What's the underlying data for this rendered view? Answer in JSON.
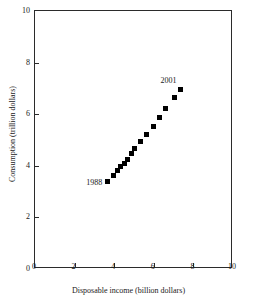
{
  "chart_data": {
    "type": "scatter",
    "title": "",
    "xlabel": "Disposable income (billion dollars)",
    "ylabel": "Consumption (trillion dollars)",
    "xlim": [
      0,
      10
    ],
    "ylim": [
      0,
      10
    ],
    "xticks": [
      0,
      2,
      4,
      6,
      8,
      10
    ],
    "yticks": [
      0,
      2,
      4,
      6,
      8,
      10
    ],
    "xtick_labels": [
      "0",
      "2",
      "4",
      "6",
      "8",
      "10"
    ],
    "ytick_labels": [
      "0",
      "2",
      "4",
      "6",
      "8",
      "10"
    ],
    "grid": false,
    "legend": false,
    "marker": "filled-square",
    "marker_color": "#000000",
    "frame": "box",
    "x": [
      3.7,
      4.0,
      4.22,
      4.38,
      4.55,
      4.72,
      4.9,
      5.1,
      5.38,
      5.7,
      6.05,
      6.32,
      6.65,
      7.1,
      7.4
    ],
    "y": [
      3.35,
      3.58,
      3.78,
      3.92,
      4.05,
      4.2,
      4.42,
      4.65,
      4.92,
      5.18,
      5.48,
      5.82,
      6.2,
      6.62,
      6.92
    ],
    "points": [
      {
        "x": 3.7,
        "y": 3.35,
        "label": "1988"
      },
      {
        "x": 4.0,
        "y": 3.58,
        "label": ""
      },
      {
        "x": 4.22,
        "y": 3.78,
        "label": ""
      },
      {
        "x": 4.38,
        "y": 3.92,
        "label": ""
      },
      {
        "x": 4.55,
        "y": 4.05,
        "label": ""
      },
      {
        "x": 4.72,
        "y": 4.2,
        "label": ""
      },
      {
        "x": 4.9,
        "y": 4.42,
        "label": ""
      },
      {
        "x": 5.1,
        "y": 4.65,
        "label": ""
      },
      {
        "x": 5.38,
        "y": 4.92,
        "label": ""
      },
      {
        "x": 5.7,
        "y": 5.18,
        "label": ""
      },
      {
        "x": 6.05,
        "y": 5.48,
        "label": ""
      },
      {
        "x": 6.32,
        "y": 5.82,
        "label": ""
      },
      {
        "x": 6.65,
        "y": 6.2,
        "label": ""
      },
      {
        "x": 7.1,
        "y": 6.62,
        "label": ""
      },
      {
        "x": 7.4,
        "y": 6.92,
        "label": "2001"
      }
    ],
    "annotations": [
      {
        "text": "1988",
        "x": 3.7,
        "y": 3.35,
        "position": "left"
      },
      {
        "text": "2001",
        "x": 7.4,
        "y": 6.92,
        "position": "upper-left"
      }
    ]
  }
}
